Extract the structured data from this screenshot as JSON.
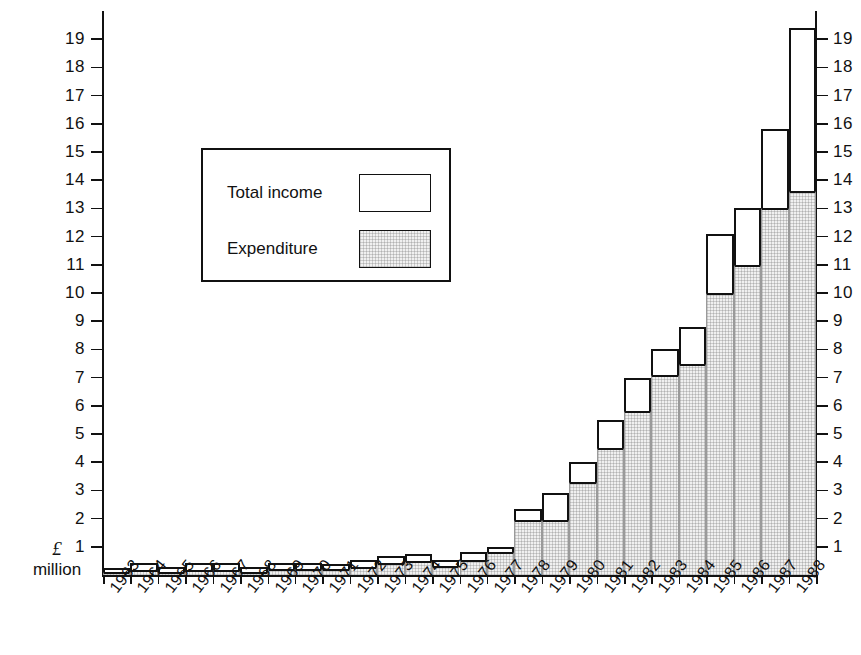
{
  "chart_data": {
    "type": "bar",
    "title": "",
    "subtitle": "",
    "xlabel": "",
    "ylabel": "£ million",
    "ylim": [
      0,
      20
    ],
    "ytick_labels": [
      "1",
      "2",
      "3",
      "4",
      "5",
      "6",
      "7",
      "8",
      "9",
      "10",
      "11",
      "12",
      "13",
      "14",
      "15",
      "16",
      "17",
      "18",
      "19"
    ],
    "ytick_values": [
      1,
      2,
      3,
      4,
      5,
      6,
      7,
      8,
      9,
      10,
      11,
      12,
      13,
      14,
      15,
      16,
      17,
      18,
      19
    ],
    "grid": false,
    "legend_position": "inside-upper-left",
    "dual_y_axis": true,
    "categories": [
      "1963",
      "1964",
      "1965",
      "1966",
      "1967",
      "1968",
      "1969",
      "1970",
      "1971",
      "1972",
      "1973",
      "1974",
      "1975",
      "1976",
      "1977",
      "1978",
      "1979",
      "1980",
      "1981",
      "1982",
      "1983",
      "1984",
      "1985",
      "1986",
      "1987",
      "1988"
    ],
    "series": [
      {
        "name": "Total income",
        "style": "outline",
        "values": [
          0.25,
          0.42,
          0.3,
          0.42,
          0.42,
          0.3,
          0.42,
          0.42,
          0.38,
          0.55,
          0.68,
          0.75,
          0.55,
          0.8,
          0.98,
          2.35,
          2.9,
          4.0,
          5.5,
          7.0,
          8.0,
          8.8,
          12.1,
          13.0,
          15.8,
          19.4
        ]
      },
      {
        "name": "Expenditure",
        "style": "stippled",
        "values": [
          0.1,
          0.18,
          0.12,
          0.18,
          0.18,
          0.12,
          0.22,
          0.22,
          0.2,
          0.3,
          0.42,
          0.48,
          0.32,
          0.52,
          0.8,
          1.95,
          1.95,
          3.3,
          4.5,
          5.8,
          7.1,
          7.5,
          10.0,
          11.0,
          13.0,
          13.6
        ]
      }
    ]
  },
  "y_caption": {
    "currency": "£",
    "unit": "million"
  },
  "legend": {
    "items": [
      {
        "label": "Total income",
        "swatch": "outline-white-box"
      },
      {
        "label": "Expenditure",
        "swatch": "stippled-gray-box"
      }
    ]
  },
  "colors": {
    "ink": "#111111",
    "background": "#ffffff",
    "expenditure_fill": "#f0f0f0",
    "income_fill": "#ffffff"
  }
}
